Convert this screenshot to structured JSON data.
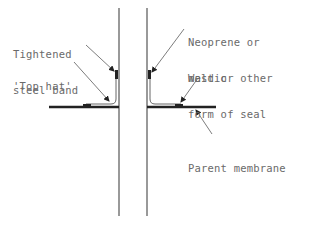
{
  "diagram": {
    "type": "technical-cross-section",
    "colors": {
      "line": "#555555",
      "membrane": "#222222",
      "text": "#6a6a6a",
      "background": "#ffffff"
    },
    "labels": {
      "steel_band_line1": "Tightened",
      "steel_band_line2": "steel band",
      "top_hat": "'Top hat'",
      "neoprene_line1": "Neoprene or",
      "neoprene_line2": "mastic",
      "weld_line1": "Weld or other",
      "weld_line2": "form of seal",
      "parent_membrane": "Parent membrane"
    }
  }
}
